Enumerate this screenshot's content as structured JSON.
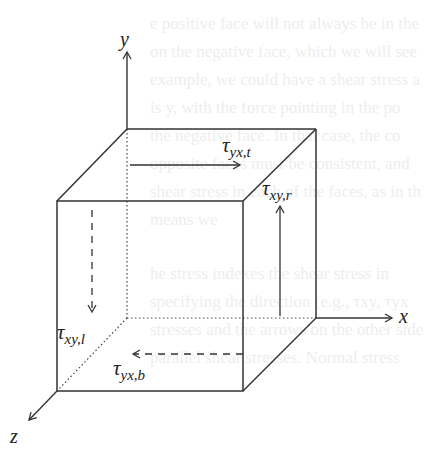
{
  "figure": {
    "type": "stress-element-cube",
    "axes": {
      "x": "x",
      "y": "y",
      "z": "z"
    },
    "stress_labels": {
      "top": {
        "symbol": "τ",
        "subscript": "yx,t",
        "direction": "+x",
        "line": "solid"
      },
      "right": {
        "symbol": "τ",
        "subscript": "xy,r",
        "direction": "+y",
        "line": "solid"
      },
      "left": {
        "symbol": "τ",
        "subscript": "xy,l",
        "direction": "-y",
        "line": "dashed"
      },
      "bottom": {
        "symbol": "τ",
        "subscript": "yx,b",
        "direction": "-x",
        "line": "dashed"
      }
    },
    "colors": {
      "line": "#333333",
      "text": "#222222",
      "background": "#ffffff"
    }
  },
  "background_bleed_lines": [
    "e positive face will not always be in the",
    "on the negative face, which we will see",
    "example, we could have a shear stress a",
    "is y,  with the force pointing in the po",
    "the negative face. In that case, the co",
    "opposite faces must be consistent, and",
    "shear stress in each of the faces, as in th",
    "means we",
    "he stress indexes the shear stress in",
    "specifying the direction (e.g., τxy, τyx",
    "stresses and the arrows on the other side",
    "parallel shear stresses. Normal stress"
  ]
}
